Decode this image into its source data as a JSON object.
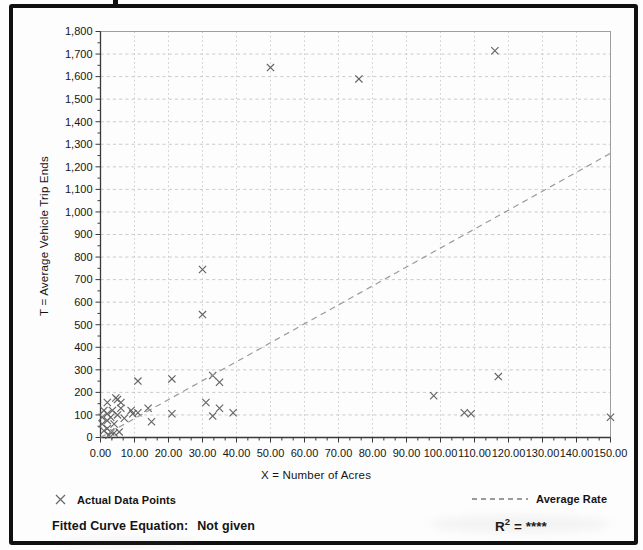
{
  "chart_data": {
    "type": "scatter",
    "title": "",
    "xlabel": "X = Number of Acres",
    "ylabel": "T = Average Vehicle Trip Ends",
    "xlim": [
      0,
      150
    ],
    "ylim": [
      0,
      1800
    ],
    "x_tick_values": [
      0,
      10,
      20,
      30,
      40,
      50,
      60,
      70,
      80,
      90,
      100,
      110,
      120,
      130,
      140,
      150
    ],
    "x_tick_labels": [
      "0.00",
      "10.00",
      "20.00",
      "30.00",
      "40.00",
      "50.00",
      "60.00",
      "70.00",
      "80.00",
      "90.00",
      "100.00",
      "110.00",
      "120.00",
      "130.00",
      "140.00",
      "150.00"
    ],
    "y_tick_values": [
      0,
      100,
      200,
      300,
      400,
      500,
      600,
      700,
      800,
      900,
      1000,
      1100,
      1200,
      1300,
      1400,
      1500,
      1600,
      1700,
      1800
    ],
    "y_tick_labels": [
      "0",
      "100",
      "200",
      "300",
      "400",
      "500",
      "600",
      "700",
      "800",
      "900",
      "1,000",
      "1,100",
      "1,200",
      "1,300",
      "1,400",
      "1,500",
      "1,600",
      "1,700",
      "1,800"
    ],
    "grid": {
      "horizontal": "dashed",
      "vertical": "dotted",
      "color": "#c5c5c5"
    },
    "legend_position": "bottom",
    "series": [
      {
        "name": "Actual Data Points",
        "type": "scatter",
        "marker": "x",
        "color": "#646464",
        "points": [
          [
            0.5,
            90
          ],
          [
            0.5,
            60
          ],
          [
            1,
            30
          ],
          [
            1,
            120
          ],
          [
            2,
            155
          ],
          [
            2,
            105
          ],
          [
            2,
            75
          ],
          [
            2,
            40
          ],
          [
            2.5,
            10
          ],
          [
            3,
            90
          ],
          [
            3,
            25
          ],
          [
            3.5,
            120
          ],
          [
            4,
            60
          ],
          [
            4,
            20
          ],
          [
            4.5,
            175
          ],
          [
            5,
            168
          ],
          [
            5,
            100
          ],
          [
            5.5,
            25
          ],
          [
            6,
            155
          ],
          [
            6,
            130
          ],
          [
            7,
            85
          ],
          [
            9,
            120
          ],
          [
            9.5,
            105
          ],
          [
            11,
            110
          ],
          [
            11,
            250
          ],
          [
            14,
            130
          ],
          [
            15,
            70
          ],
          [
            21,
            260
          ],
          [
            21,
            105
          ],
          [
            30,
            745
          ],
          [
            30,
            545
          ],
          [
            31,
            155
          ],
          [
            33,
            275
          ],
          [
            33,
            95
          ],
          [
            35,
            245
          ],
          [
            35,
            130
          ],
          [
            39,
            110
          ],
          [
            50,
            1640
          ],
          [
            76,
            1590
          ],
          [
            98,
            185
          ],
          [
            107,
            110
          ],
          [
            109,
            105
          ],
          [
            116,
            1715
          ],
          [
            117,
            270
          ],
          [
            150,
            90
          ]
        ]
      },
      {
        "name": "Average Rate",
        "type": "line",
        "style": "dashed",
        "color": "#9b9b9b",
        "points": [
          [
            0,
            0
          ],
          [
            150,
            1260
          ]
        ]
      }
    ]
  },
  "legend": {
    "actual": "Actual Data Points",
    "rate": "Average Rate"
  },
  "footer": {
    "equation_label": "Fitted Curve Equation:",
    "equation_value": "Not given",
    "r2_base": "R",
    "r2_sup": "2",
    "r2_rest": "= ****"
  }
}
